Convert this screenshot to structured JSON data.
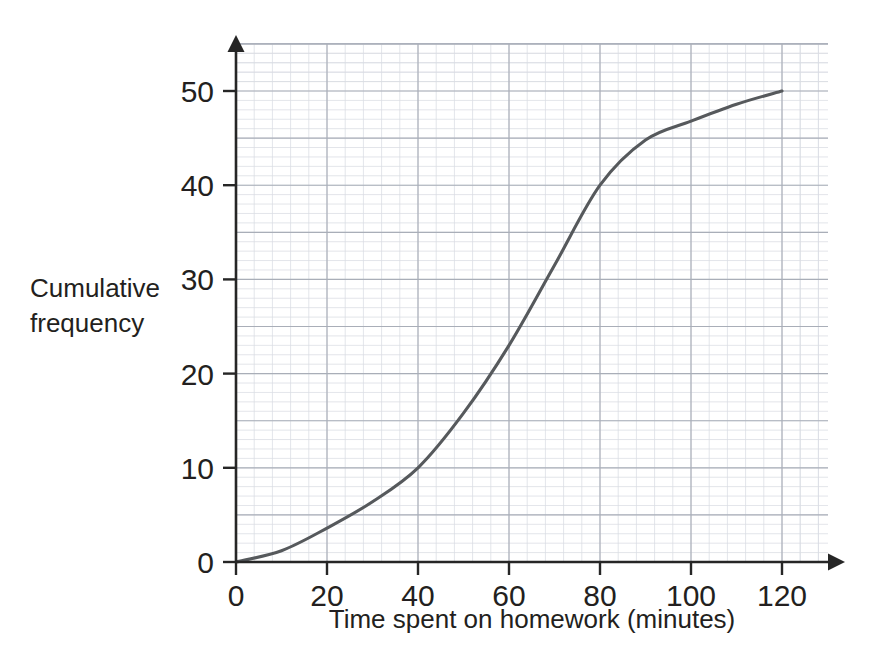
{
  "figure": {
    "name": "cumulative-frequency-graph",
    "background_color": "#ffffff"
  },
  "chart_data": {
    "type": "line",
    "title": "",
    "subtitle": "",
    "xlabel": "Time spent on homework (minutes)",
    "ylabel": "Cumulative frequency",
    "ylabel_line1": "Cumulative",
    "ylabel_line2": "frequency",
    "xlim": [
      0,
      120
    ],
    "ylim": [
      0,
      50
    ],
    "x_ticks": [
      0,
      20,
      40,
      60,
      80,
      100,
      120
    ],
    "x_tick_labels": [
      "0",
      "20",
      "40",
      "60",
      "80",
      "100",
      "120"
    ],
    "y_ticks": [
      0,
      10,
      20,
      30,
      40,
      50
    ],
    "y_tick_labels": [
      "0",
      "10",
      "20",
      "30",
      "40",
      "50"
    ],
    "grid": {
      "visible": true,
      "minor": true,
      "major": true,
      "minor_color": "#d9dce3",
      "major_color": "#a9aeb8",
      "minor_step_x": 4,
      "minor_step_y": 1,
      "major_step_x": 20,
      "major_step_y": 5
    },
    "legend": {
      "visible": false,
      "position": "none"
    },
    "series": [
      {
        "name": "Cumulative frequency",
        "color": "#56595c",
        "x": [
          0,
          10,
          20,
          30,
          40,
          50,
          60,
          70,
          80,
          90,
          100,
          110,
          120
        ],
        "values": [
          0,
          1.2,
          3.6,
          6.4,
          10,
          15.8,
          23,
          31.5,
          40,
          44.8,
          46.8,
          48.6,
          50
        ]
      }
    ],
    "annotations": []
  },
  "axes": {
    "x_arrow": "arrow-right",
    "y_arrow": "arrow-up"
  }
}
